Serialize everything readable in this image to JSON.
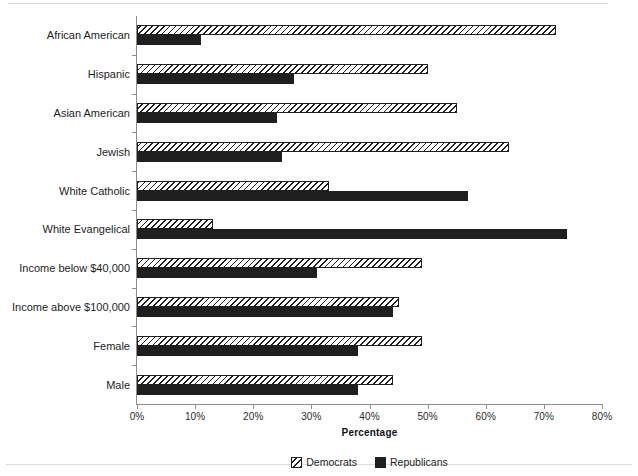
{
  "chart_data": {
    "type": "bar",
    "orientation": "horizontal",
    "title": "",
    "xlabel": "Percentage",
    "ylabel": "",
    "xlim": [
      0,
      80
    ],
    "xticks": [
      "0%",
      "10%",
      "20%",
      "30%",
      "40%",
      "50%",
      "60%",
      "70%",
      "80%"
    ],
    "xtick_values": [
      0,
      10,
      20,
      30,
      40,
      50,
      60,
      70,
      80
    ],
    "grid": false,
    "legend_position": "bottom-center",
    "categories": [
      "African American",
      "Hispanic",
      "Asian American",
      "Jewish",
      "White Catholic",
      "White Evangelical",
      "Income below $40,000",
      "Income above $100,000",
      "Female",
      "Male"
    ],
    "series": [
      {
        "name": "Democrats",
        "pattern": "diagonal-hatch",
        "color": "#ffffff",
        "edge_color": "#1f1f1f",
        "values": [
          72,
          50,
          55,
          64,
          33,
          13,
          49,
          45,
          49,
          44
        ]
      },
      {
        "name": "Republicans",
        "pattern": "solid",
        "color": "#201f1f",
        "edge_color": "#201f1f",
        "values": [
          11,
          27,
          24,
          25,
          57,
          74,
          31,
          44,
          38,
          38
        ]
      }
    ]
  },
  "legend": {
    "items": [
      {
        "label": "Democrats",
        "swatch": "diagonal-hatch-swatch"
      },
      {
        "label": "Republicans",
        "swatch": "solid-black-swatch"
      }
    ]
  },
  "axis": {
    "x_title": "Percentage"
  }
}
